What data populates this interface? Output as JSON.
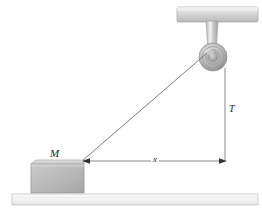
{
  "figure": {
    "type": "physics-free-body-diagram",
    "width": 262,
    "height": 220,
    "background_color": "#ffffff"
  },
  "labels": {
    "mass": "M",
    "tension": "T",
    "distance": "x"
  },
  "colors": {
    "block_fill_light": "#cfcfcf",
    "block_fill_dark": "#a8a8a8",
    "block_stroke": "#8c8c8c",
    "ground_fill": "#f4f4f4",
    "ground_stroke": "#b8b8b8",
    "beam_fill": "#d9d9d9",
    "beam_stroke": "#a0a0a0",
    "pulley_outer": "#b5b5b5",
    "pulley_inner": "#9a9a9a",
    "string": "#6e6e6e",
    "dimension_line": "#6b6b6b",
    "label_text": "#1c1c1c"
  },
  "elements": {
    "ceiling_beam": {
      "name": "ceiling-beam",
      "x": 177,
      "y": 7,
      "width": 81,
      "height": 15
    },
    "pulley_bracket": {
      "name": "pulley-bracket",
      "x": 204,
      "y": 21,
      "width": 16,
      "height": 30
    },
    "pulley": {
      "name": "pulley-wheel",
      "cx": 213,
      "cy": 57,
      "r_outer": 14,
      "r_mid": 10,
      "r_hub": 5
    },
    "block": {
      "name": "block-mass-m",
      "x": 31,
      "y": 161,
      "width": 53,
      "height": 32
    },
    "ground": {
      "name": "ground-surface",
      "x": 12,
      "y": 194,
      "width": 246,
      "height": 11
    },
    "string": {
      "name": "string-segment",
      "x1": 82,
      "y1": 161,
      "x2": 209,
      "y2": 52
    },
    "dimension_horizontal": {
      "name": "dimension-line-x",
      "x1": 84,
      "y1": 161,
      "x2": 225,
      "y2": 161
    },
    "dimension_vertical": {
      "name": "dimension-line-t",
      "x1": 225,
      "y1": 68,
      "x2": 225,
      "y2": 161
    }
  }
}
